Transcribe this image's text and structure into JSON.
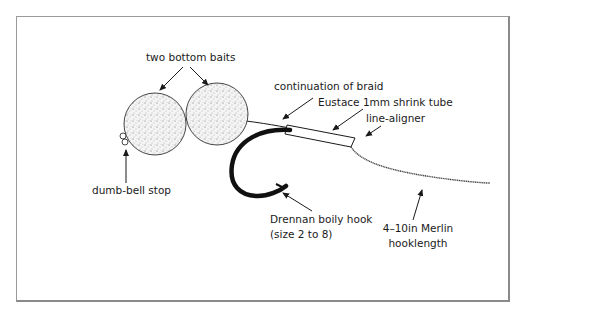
{
  "diagram": {
    "labels": {
      "bottom_baits": "two bottom baits",
      "dumbbell_stop": "dumb-bell stop",
      "braid": "continuation of braid",
      "shrink_tube": "Eustace 1mm shrink tube",
      "line_aligner": "line-aligner",
      "hook_line1": "Drennan boily hook",
      "hook_line2": "(size 2 to 8)",
      "hooklength_line1": "4–10in Merlin",
      "hooklength_line2": "hooklength"
    },
    "colors": {
      "ink": "#1a1a1a",
      "frame": "#9a9a9a",
      "bait_fill": "#f2f2f2"
    }
  }
}
